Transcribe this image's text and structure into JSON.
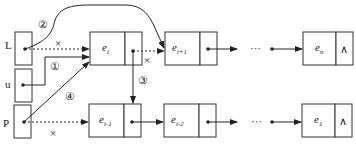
{
  "diagram": {
    "pointers": [
      {
        "id": "L",
        "label": "L"
      },
      {
        "id": "u",
        "label": "u"
      },
      {
        "id": "P",
        "label": "P"
      }
    ],
    "top_row": [
      {
        "label": "e",
        "sub": "i"
      },
      {
        "label": "e",
        "sub": "i+1"
      },
      {
        "label": "e",
        "sub": "n",
        "next": "∧"
      }
    ],
    "bottom_row": [
      {
        "label": "e",
        "sub": "i-1"
      },
      {
        "label": "e",
        "sub": "i-2"
      },
      {
        "label": "e",
        "sub": "1",
        "next": "∧"
      }
    ],
    "ellipsis": "···",
    "step_markers": [
      "①",
      "②",
      "③",
      "④"
    ],
    "removed_mark": "×",
    "null_symbol": "∧"
  }
}
